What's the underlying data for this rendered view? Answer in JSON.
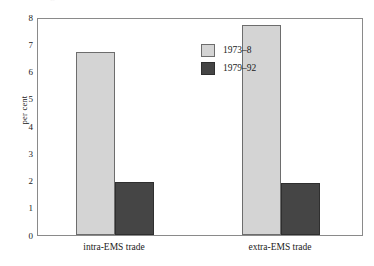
{
  "caption_remnant": "trade growth and the EMS",
  "chart_data": {
    "type": "bar",
    "title": "",
    "xlabel": "",
    "ylabel": "per cent",
    "categories": [
      "intra-EMS trade",
      "extra-EMS trade"
    ],
    "series": [
      {
        "name": "1973–8",
        "values": [
          6.7,
          7.7
        ],
        "color": "#d4d4d4"
      },
      {
        "name": "1979–92",
        "values": [
          1.95,
          1.9
        ],
        "color": "#454545"
      }
    ],
    "ylim": [
      0,
      8
    ],
    "yticks": [
      "0",
      "1",
      "2",
      "3",
      "4",
      "5",
      "6",
      "7",
      "8"
    ],
    "grid": false,
    "legend_position": "inside-top-center",
    "frame_color": "#8a8a8a"
  }
}
